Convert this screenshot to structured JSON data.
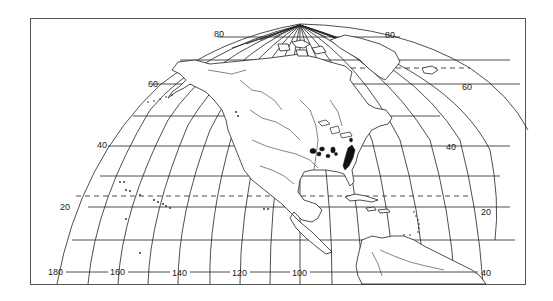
{
  "map": {
    "title": "Amblyopsidae",
    "projection": "oblique equal-area, North America centered",
    "latitude_labels": {
      "left": [
        "80",
        "60",
        "40",
        "20"
      ],
      "right": [
        "80",
        "60",
        "40",
        "20"
      ]
    },
    "longitude_labels": [
      "180",
      "160",
      "140",
      "120",
      "100",
      "40"
    ],
    "dashed_line": "Tropic of Cancer (~23.5)",
    "distribution": {
      "family": "Amblyopsidae",
      "region": "Eastern United States (karst cave regions)",
      "fill_color": "#111111"
    },
    "colors": {
      "line": "#222222",
      "frame": "#555555",
      "background": "#ffffff"
    }
  }
}
